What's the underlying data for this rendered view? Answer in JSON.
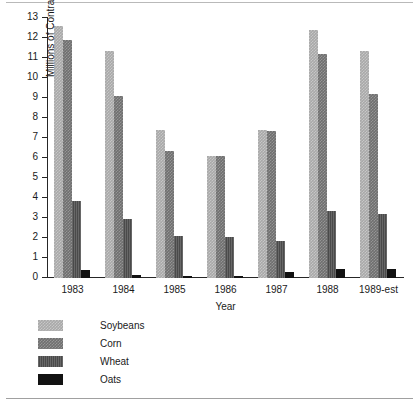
{
  "chart_data": {
    "type": "bar",
    "title": "",
    "xlabel": "Year",
    "ylabel": "Millions of Contracts Traded",
    "ylim": [
      0,
      13
    ],
    "ytick_step": 1,
    "grid": false,
    "legend_position": "below-left",
    "categories": [
      "1983",
      "1984",
      "1985",
      "1986",
      "1987",
      "1988",
      "1989-est"
    ],
    "yticks": [
      "0",
      "1",
      "2",
      "3",
      "4",
      "5",
      "6",
      "7",
      "8",
      "9",
      "10",
      "11",
      "12",
      "13"
    ],
    "series": [
      {
        "name": "Soybeans",
        "color": "#a9a9a9",
        "values": [
          12.6,
          11.35,
          7.4,
          6.1,
          7.4,
          12.4,
          11.35
        ]
      },
      {
        "name": "Corn",
        "color": "#6f6f6f",
        "values": [
          11.9,
          9.1,
          6.35,
          6.1,
          7.35,
          11.2,
          9.2
        ]
      },
      {
        "name": "Wheat",
        "color": "#4a4a4a",
        "values": [
          3.85,
          2.95,
          2.1,
          2.05,
          1.85,
          3.35,
          3.2
        ]
      },
      {
        "name": "Oats",
        "color": "#121212",
        "values": [
          0.4,
          0.15,
          0.1,
          0.1,
          0.3,
          0.45,
          0.45
        ]
      }
    ]
  }
}
